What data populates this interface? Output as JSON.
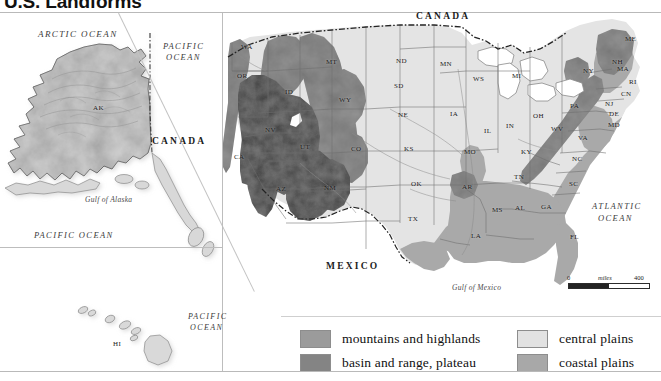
{
  "title": "U.S. Landforms",
  "legend": {
    "items": [
      {
        "label": "mountains and highlands",
        "color": "#9b9b9b"
      },
      {
        "label": "basin and range, plateau",
        "color": "#848484"
      },
      {
        "label": "central plains",
        "color": "#e2e2e2"
      },
      {
        "label": "coastal plains",
        "color": "#a8a8a8"
      }
    ]
  },
  "scale": {
    "min": "0",
    "unit": "miles",
    "max": "400"
  },
  "oceans": [
    {
      "name": "ARCTIC OCEAN",
      "lines": [
        "ARCTIC OCEAN"
      ]
    },
    {
      "name": "PACIFIC OCEAN inset top",
      "lines": [
        "PACIFIC",
        "OCEAN"
      ]
    },
    {
      "name": "PACIFIC OCEAN inset bottom",
      "lines": [
        "PACIFIC OCEAN"
      ]
    },
    {
      "name": "PACIFIC OCEAN hawaii",
      "lines": [
        "PACIFIC",
        "OCEAN"
      ]
    },
    {
      "name": "ATLANTIC OCEAN",
      "lines": [
        "ATLANTIC",
        "OCEAN"
      ]
    }
  ],
  "ocean_labels": {
    "arctic": "ARCTIC OCEAN",
    "pacific_line1": "PACIFIC",
    "pacific_line2": "OCEAN",
    "pacific_full": "PACIFIC OCEAN",
    "atlantic_line1": "ATLANTIC",
    "atlantic_line2": "OCEAN"
  },
  "countries": {
    "canada_main": "CANADA",
    "canada_inset": "CANADA",
    "mexico": "MEXICO"
  },
  "water_bodies": {
    "gulf_of_alaska": "Gulf of Alaska",
    "gulf_of_mexico": "Gulf of Mexico"
  },
  "states": [
    {
      "abbr": "AK",
      "x": 93,
      "y": 104
    },
    {
      "abbr": "HI",
      "x": 113,
      "y": 340
    },
    {
      "abbr": "WA",
      "x": 241,
      "y": 43
    },
    {
      "abbr": "OR",
      "x": 237,
      "y": 72
    },
    {
      "abbr": "ID",
      "x": 285,
      "y": 88
    },
    {
      "abbr": "MT",
      "x": 326,
      "y": 58
    },
    {
      "abbr": "ND",
      "x": 396,
      "y": 57
    },
    {
      "abbr": "SD",
      "x": 394,
      "y": 82
    },
    {
      "abbr": "NE",
      "x": 398,
      "y": 111
    },
    {
      "abbr": "KS",
      "x": 404,
      "y": 145
    },
    {
      "abbr": "OK",
      "x": 411,
      "y": 180
    },
    {
      "abbr": "TX",
      "x": 408,
      "y": 215
    },
    {
      "abbr": "MN",
      "x": 440,
      "y": 60
    },
    {
      "abbr": "WS",
      "x": 473,
      "y": 75
    },
    {
      "abbr": "MI",
      "x": 512,
      "y": 72
    },
    {
      "abbr": "IA",
      "x": 450,
      "y": 110
    },
    {
      "abbr": "MO",
      "x": 464,
      "y": 148
    },
    {
      "abbr": "AR",
      "x": 462,
      "y": 183
    },
    {
      "abbr": "LA",
      "x": 471,
      "y": 232
    },
    {
      "abbr": "MS",
      "x": 492,
      "y": 206
    },
    {
      "abbr": "AL",
      "x": 515,
      "y": 204
    },
    {
      "abbr": "GA",
      "x": 541,
      "y": 203
    },
    {
      "abbr": "FL",
      "x": 570,
      "y": 233
    },
    {
      "abbr": "IL",
      "x": 484,
      "y": 127
    },
    {
      "abbr": "IN",
      "x": 506,
      "y": 122
    },
    {
      "abbr": "OH",
      "x": 533,
      "y": 112
    },
    {
      "abbr": "KY",
      "x": 521,
      "y": 148
    },
    {
      "abbr": "TN",
      "x": 514,
      "y": 173
    },
    {
      "abbr": "NV",
      "x": 265,
      "y": 126
    },
    {
      "abbr": "UT",
      "x": 300,
      "y": 143
    },
    {
      "abbr": "CA",
      "x": 234,
      "y": 153
    },
    {
      "abbr": "AZ",
      "x": 276,
      "y": 185
    },
    {
      "abbr": "NM",
      "x": 324,
      "y": 184
    },
    {
      "abbr": "CO",
      "x": 351,
      "y": 145
    },
    {
      "abbr": "WY",
      "x": 339,
      "y": 96
    },
    {
      "abbr": "WV",
      "x": 551,
      "y": 125
    },
    {
      "abbr": "VA",
      "x": 578,
      "y": 134
    },
    {
      "abbr": "NC",
      "x": 572,
      "y": 155
    },
    {
      "abbr": "SC",
      "x": 569,
      "y": 180
    },
    {
      "abbr": "PA",
      "x": 570,
      "y": 102
    },
    {
      "abbr": "NY",
      "x": 583,
      "y": 67
    },
    {
      "abbr": "ME",
      "x": 625,
      "y": 35
    },
    {
      "abbr": "NH",
      "x": 612,
      "y": 58
    },
    {
      "abbr": "MA",
      "x": 617,
      "y": 65
    },
    {
      "abbr": "RI",
      "x": 629,
      "y": 78
    },
    {
      "abbr": "CN",
      "x": 621,
      "y": 90
    },
    {
      "abbr": "NJ",
      "x": 605,
      "y": 100
    },
    {
      "abbr": "DE",
      "x": 609,
      "y": 110
    },
    {
      "abbr": "MD",
      "x": 608,
      "y": 121
    }
  ],
  "colors": {
    "mountains_highlands": "#9b9b9b",
    "basin_range_plateau": "#848484",
    "central_plains": "#e2e2e2",
    "coastal_plains": "#a8a8a8",
    "ocean": "#ffffff",
    "border": "#6d6d6d",
    "text": "#111111"
  }
}
